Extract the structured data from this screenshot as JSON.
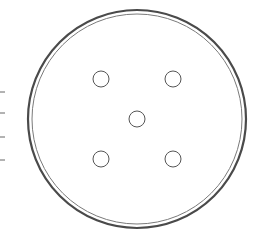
{
  "diagram": {
    "plate": {
      "cx": 137,
      "cy": 119,
      "outer_r": 109,
      "inner_r": 105,
      "stroke_outer": "#4a4a4a",
      "stroke_inner": "#7a7a7a"
    },
    "holes": [
      {
        "cx": 101,
        "cy": 79,
        "r": 8
      },
      {
        "cx": 173,
        "cy": 79,
        "r": 8
      },
      {
        "cx": 137,
        "cy": 119,
        "r": 8
      },
      {
        "cx": 101,
        "cy": 159,
        "r": 8
      },
      {
        "cx": 173,
        "cy": 159,
        "r": 8
      }
    ],
    "ticks": [
      {
        "y": 92
      },
      {
        "y": 113
      },
      {
        "y": 137
      },
      {
        "y": 160
      }
    ],
    "hole_stroke": "#555555",
    "tick_stroke": "#666666"
  }
}
